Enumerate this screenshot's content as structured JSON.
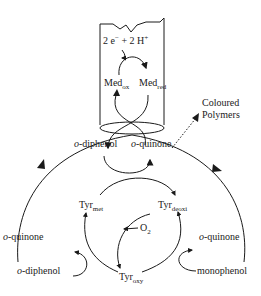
{
  "diagram": {
    "electrode": {
      "reaction_prefix": "2 e",
      "reaction_sup_e": "−",
      "reaction_mid": " + 2 H",
      "reaction_sup_h": "+",
      "med_ox": {
        "base": "Med",
        "sub": "ox"
      },
      "med_red": {
        "base": "Med",
        "sub": "red"
      }
    },
    "coloured_polymers": {
      "line1": "Coloured",
      "line2": "Polymers"
    },
    "center": {
      "diphenol": {
        "prefix": "o",
        "rest": "-diphenol"
      },
      "quinone": {
        "prefix": "o",
        "rest": "-quinone"
      }
    },
    "enzyme": {
      "tyr_met": {
        "base": "Tyr",
        "sub": "met"
      },
      "tyr_deoxi": {
        "base": "Tyr",
        "sub": "deoxi"
      },
      "tyr_oxy": {
        "base": "Tyr",
        "sub": "oxy"
      },
      "o2": {
        "base": "O",
        "sub": "2"
      }
    },
    "left_branch": {
      "quinone": {
        "prefix": "o",
        "rest": "-quinone"
      },
      "diphenol": {
        "prefix": "o",
        "rest": "-diphenol"
      }
    },
    "right_branch": {
      "quinone": {
        "prefix": "o",
        "rest": "-quinone"
      },
      "monophenol": "monophenol"
    }
  }
}
